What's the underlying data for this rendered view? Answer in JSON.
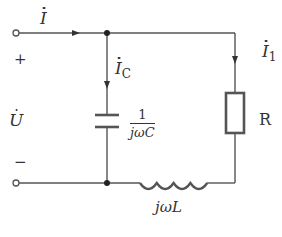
{
  "diagram": {
    "type": "circuit",
    "labels": {
      "source_current": "I",
      "capacitor_current_base": "I",
      "capacitor_current_sub": "C",
      "resistor_current_base": "I",
      "resistor_current_sub": "1",
      "voltage": "U",
      "plus": "+",
      "minus": "−",
      "resistor": "R",
      "capacitor_impedance_num": "1",
      "capacitor_impedance_den": "jωC",
      "inductor_impedance": "jωL"
    },
    "components": [
      {
        "id": "C",
        "kind": "capacitor",
        "impedance": "1/(jωC)"
      },
      {
        "id": "R",
        "kind": "resistor",
        "label": "R"
      },
      {
        "id": "L",
        "kind": "inductor",
        "impedance": "jωL"
      }
    ],
    "topology": "Capacitor in parallel with series (R + L) branch, driven by phasor voltage U",
    "colors": {
      "wire": "#555555",
      "text": "#333333",
      "background": "#ffffff"
    }
  }
}
